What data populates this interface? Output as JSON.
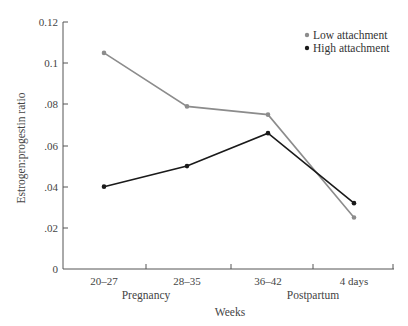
{
  "chart_data": {
    "type": "line",
    "title": "",
    "xlabel": "Weeks",
    "ylabel": "Estrogen:progestin ratio",
    "categories": [
      "20–27",
      "28–35",
      "36–42",
      "4 days"
    ],
    "category_groups": [
      {
        "label": "Pregnancy",
        "spans": [
          "20–27",
          "28–35"
        ]
      },
      {
        "label": "Postpartum",
        "spans": [
          "36–42",
          "4 days"
        ]
      }
    ],
    "y_ticks": [
      {
        "value": 0,
        "label": "0"
      },
      {
        "value": 0.02,
        "label": ".02"
      },
      {
        "value": 0.04,
        "label": ".04"
      },
      {
        "value": 0.06,
        "label": ".06"
      },
      {
        "value": 0.08,
        "label": ".08"
      },
      {
        "value": 0.1,
        "label": "0.1"
      },
      {
        "value": 0.12,
        "label": "0.12"
      }
    ],
    "ylim": [
      0,
      0.12
    ],
    "grid": false,
    "legend_position": "top-right",
    "series": [
      {
        "name": "Low attachment",
        "color": "#8c8c8c",
        "values": [
          0.105,
          0.079,
          0.075,
          0.025
        ]
      },
      {
        "name": "High attachment",
        "color": "#1a1a1a",
        "values": [
          0.04,
          0.05,
          0.066,
          0.032
        ]
      }
    ]
  },
  "legend": {
    "items": [
      {
        "label": "Low attachment",
        "color": "#8c8c8c"
      },
      {
        "label": "High attachment",
        "color": "#1a1a1a"
      }
    ]
  },
  "axes": {
    "x_title": "Weeks",
    "y_title": "Estrogen:progestin ratio",
    "x_group_pregnancy": "Pregnancy",
    "x_group_postpartum": "Postpartum",
    "x_tick_labels": [
      "20–27",
      "28–35",
      "36–42",
      "4 days"
    ],
    "y_tick_labels": [
      "0",
      ".02",
      ".04",
      ".06",
      ".08",
      "0.1",
      "0.12"
    ]
  }
}
